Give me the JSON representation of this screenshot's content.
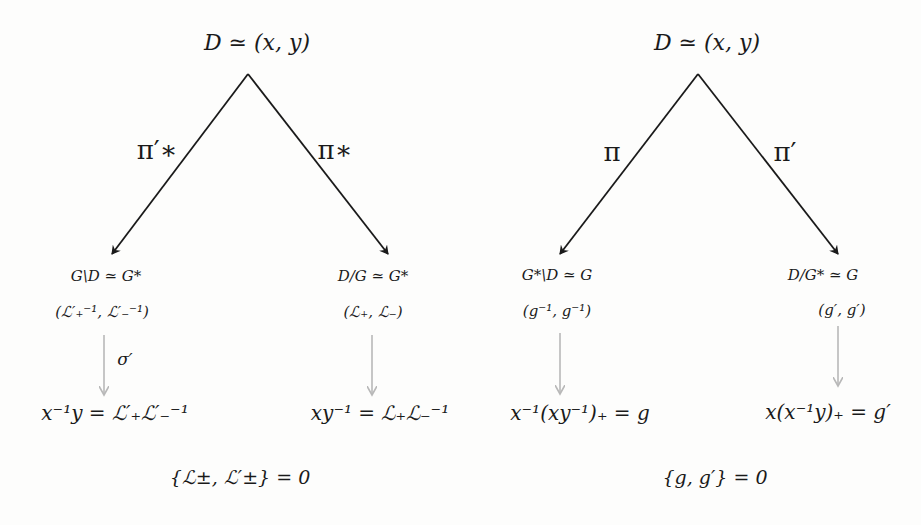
{
  "left_diagram": {
    "top_node": "D ≃ (x, y)",
    "left_arrow_label": "π′∗",
    "right_arrow_label": "π∗",
    "left_node": {
      "line1": "G\\D ≃ G*",
      "line2": "(ℒ′₊⁻¹, ℒ′₋⁻¹)"
    },
    "right_node": {
      "line1": "D/G ≃ G*",
      "line2": "(ℒ₊, ℒ₋)"
    },
    "left_map_label": "σ′",
    "left_result": "x⁻¹y = ℒ′₊ℒ′₋⁻¹",
    "right_result": "xy⁻¹ = ℒ₊ℒ₋⁻¹",
    "poisson_bracket": "{ℒ±, ℒ′±} = 0"
  },
  "right_diagram": {
    "top_node": "D ≃ (x, y)",
    "left_arrow_label": "π",
    "right_arrow_label": "π′",
    "left_node": {
      "line1": "G*\\D ≃ G",
      "line2": "(g⁻¹, g⁻¹)"
    },
    "right_node": {
      "line1": "D/G* ≃ G",
      "line2": "(g′, g′)"
    },
    "left_result": "x⁻¹(xy⁻¹)₊ = g",
    "right_result": "x(x⁻¹y)₊ = g′",
    "poisson_bracket": "{g, g′} = 0"
  },
  "colors": {
    "main_arrow": "#1a1a1a",
    "secondary_arrow": "#b8b8b8",
    "background": "#fdfdfc"
  }
}
